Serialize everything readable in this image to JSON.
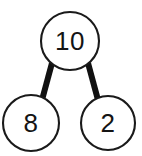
{
  "figure": {
    "name": "number-bond",
    "title": "10 = 8 + 2",
    "background_color": "#ffffff",
    "stroke_color": "#1a1a1a",
    "link_color": "#111111",
    "text_color": "#141414"
  },
  "nodes": {
    "whole": {
      "label": "10",
      "role": "whole",
      "cx": 70,
      "cy": 41,
      "r": 29
    },
    "part_left": {
      "label": "8",
      "role": "part",
      "cx": 31,
      "cy": 123,
      "r": 28
    },
    "part_right": {
      "label": "2",
      "role": "part",
      "cx": 108,
      "cy": 123,
      "r": 27
    }
  },
  "links": [
    {
      "name": "whole-to-left-part",
      "from": "whole",
      "to": "part_left"
    },
    {
      "name": "whole-to-right-part",
      "from": "whole",
      "to": "part_right"
    }
  ]
}
